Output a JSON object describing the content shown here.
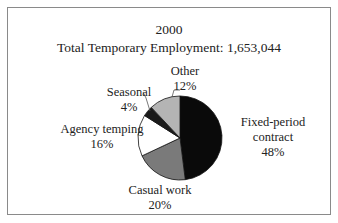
{
  "chart_data": {
    "type": "pie",
    "title": "2000",
    "subtitle": "Total Temporary Employment: 1,653,044",
    "categories": [
      "Fixed-period contract",
      "Casual work",
      "Agency temping",
      "Seasonal",
      "Other"
    ],
    "values": [
      48,
      20,
      16,
      4,
      12
    ],
    "value_labels": [
      "48%",
      "20%",
      "16%",
      "4%",
      "12%"
    ],
    "colors": [
      "#0a0a0a",
      "#7a7a7a",
      "#ffffff",
      "#1a1a1a",
      "#b4b4b4"
    ],
    "start_angle": "12 o'clock",
    "direction": "clockwise",
    "legend": "none (direct labels)"
  },
  "labels": {
    "fixed_line1": "Fixed-period",
    "fixed_line2": "contract",
    "fixed_pct": "48%",
    "casual_line1": "Casual work",
    "casual_pct": "20%",
    "agency_line1": "Agency temping",
    "agency_pct": "16%",
    "seasonal_line1": "Seasonal",
    "seasonal_pct": "4%",
    "other_line1": "Other",
    "other_pct": "12%"
  }
}
